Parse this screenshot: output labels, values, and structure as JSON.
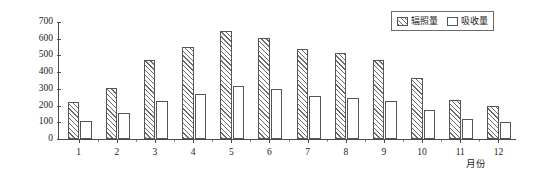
{
  "chart_data": {
    "type": "bar",
    "title": "",
    "xlabel": "月份",
    "ylabel": "辐照量·吸收量/(MJ·m⁻²)",
    "ylabel_main": "辐照量·吸收量/(MJ·m",
    "ylabel_exp": "-2",
    "ylabel_tail": ")",
    "categories": [
      "1",
      "2",
      "3",
      "4",
      "5",
      "6",
      "7",
      "8",
      "9",
      "10",
      "11",
      "12"
    ],
    "series": [
      {
        "name": "辐照量",
        "pattern": "diagonal-hatch",
        "values": [
          220,
          305,
          470,
          552,
          645,
          603,
          540,
          512,
          472,
          365,
          235,
          195
        ]
      },
      {
        "name": "吸收量",
        "pattern": "solid-white",
        "values": [
          110,
          155,
          230,
          270,
          317,
          297,
          258,
          248,
          228,
          175,
          117,
          100
        ]
      }
    ],
    "ylim": [
      0,
      700
    ],
    "yticks": [
      0,
      100,
      200,
      300,
      400,
      500,
      600,
      700
    ],
    "ytick_labels": [
      "0",
      "100",
      "200",
      "300",
      "400",
      "500",
      "600",
      "700"
    ],
    "grid": false,
    "legend_position": "top-right"
  },
  "legend": {
    "items": [
      {
        "label": "辐照量",
        "swatch": "hatched"
      },
      {
        "label": "吸收量",
        "swatch": "white"
      }
    ]
  },
  "colors": {
    "axis": "#4a4a4a",
    "hatch": "#6b6b6b",
    "bar_border": "#555555",
    "background": "#ffffff",
    "text": "#1a1a1a"
  }
}
